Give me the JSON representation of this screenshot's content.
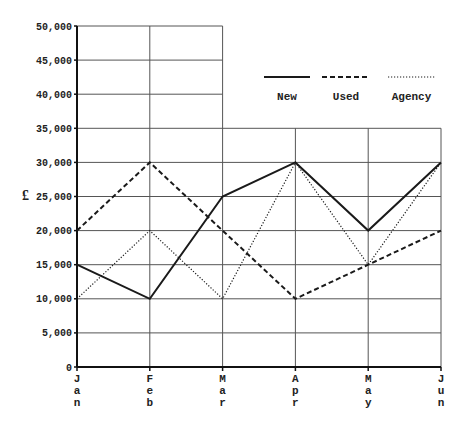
{
  "chart_data": {
    "type": "line",
    "title": "",
    "xlabel": "",
    "ylabel": "£",
    "categories": [
      "Jan",
      "Feb",
      "Mar",
      "Apr",
      "May",
      "Jun"
    ],
    "ylim": [
      0,
      50000
    ],
    "yticks": [
      0,
      5000,
      10000,
      15000,
      20000,
      25000,
      30000,
      35000,
      40000,
      45000,
      50000
    ],
    "ytick_labels": [
      "0",
      "5,000",
      "10,000",
      "15,000",
      "20,000",
      "25,000",
      "30,000",
      "35,000",
      "40,000",
      "45,000",
      "50,000"
    ],
    "grid": true,
    "legend_position": "upper right",
    "series": [
      {
        "name": "New",
        "style": "solid",
        "values": [
          15000,
          10000,
          25000,
          30000,
          20000,
          30000
        ]
      },
      {
        "name": "Used",
        "style": "dashed",
        "values": [
          20000,
          30000,
          20000,
          10000,
          15000,
          20000
        ]
      },
      {
        "name": "Agency",
        "style": "dotted",
        "values": [
          10000,
          20000,
          10000,
          30000,
          15000,
          30000
        ]
      }
    ],
    "colors": {
      "line": "#1a1a1a",
      "grid": "#555555",
      "axis": "#111111"
    }
  }
}
